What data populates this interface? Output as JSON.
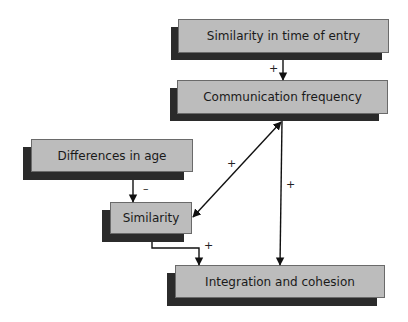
{
  "nodes": {
    "entry_time": "Similarity in time of entry",
    "comm_freq": "Communication frequency",
    "age_diff": "Differences in age",
    "similarity": "Similarity",
    "integration": "Integration and cohesion"
  },
  "edges": [
    {
      "from": "Similarity in time of entry",
      "to": "Communication frequency",
      "sign": "+"
    },
    {
      "from": "Communication frequency",
      "to": "Similarity",
      "sign": "+",
      "bidirectional": true
    },
    {
      "from": "Communication frequency",
      "to": "Integration and cohesion",
      "sign": "+"
    },
    {
      "from": "Differences in age",
      "to": "Similarity",
      "sign": "–"
    },
    {
      "from": "Similarity",
      "to": "Integration and cohesion",
      "sign": "+"
    }
  ],
  "signs": {
    "entry_to_comm": "+",
    "comm_sim": "+",
    "comm_to_integ": "+",
    "age_to_sim": "–",
    "sim_to_integ": "+"
  },
  "colors": {
    "box_fill": "#bcbcbc",
    "shadow": "#2b2b2b",
    "line": "#111111"
  }
}
